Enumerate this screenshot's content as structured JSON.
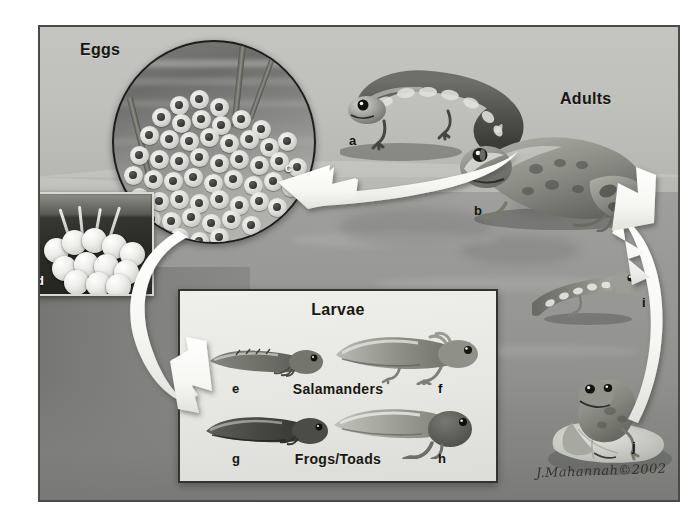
{
  "figure": {
    "title_labels": {
      "eggs": "Eggs",
      "adults": "Adults",
      "larvae": "Larvae",
      "salamanders": "Salamanders",
      "frogs_toads": "Frogs/Toads"
    },
    "signature": "J.Mahannah©2002",
    "keys": {
      "a": "a",
      "b": "b",
      "c": "c",
      "d": "d",
      "e": "e",
      "f": "f",
      "g": "g",
      "h": "h",
      "i": "i",
      "j": "j"
    },
    "colors": {
      "background_light": "#c4c4c1",
      "water": "#979895",
      "larvae_panel": "#e9e9e6",
      "frame_border": "#4a4a4a",
      "arrow_fill": "#fbfbf8",
      "label_text": "#17170f",
      "inset_d_background": "#2b2c28"
    },
    "arrows": [
      {
        "name": "eggs-to-adults",
        "from": "eggs",
        "to": "adults",
        "direction": "left"
      },
      {
        "name": "eggs-to-larvae",
        "from": "eggs",
        "to": "larvae",
        "direction": "down"
      },
      {
        "name": "juveniles-to-adults",
        "from": "juveniles",
        "to": "adults",
        "direction": "up"
      }
    ],
    "subjects": [
      {
        "key": "a",
        "name": "adult-salamander"
      },
      {
        "key": "b",
        "name": "adult-frog"
      },
      {
        "key": "c",
        "name": "salamander-egg-mass"
      },
      {
        "key": "d",
        "name": "frog-egg-cluster"
      },
      {
        "key": "e",
        "name": "salamander-larva-early"
      },
      {
        "key": "f",
        "name": "salamander-larva-late"
      },
      {
        "key": "g",
        "name": "tadpole-early"
      },
      {
        "key": "h",
        "name": "tadpole-with-legs"
      },
      {
        "key": "i",
        "name": "juvenile-salamander"
      },
      {
        "key": "j",
        "name": "juvenile-frog"
      }
    ]
  }
}
